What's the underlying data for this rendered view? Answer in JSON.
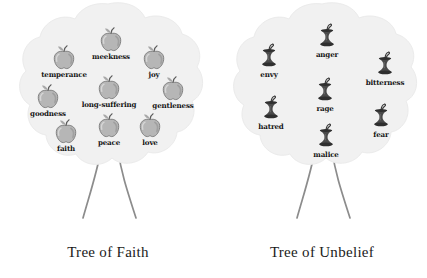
{
  "figure": {
    "caption_left": "Tree of Faith",
    "caption_right": "Tree of Unbelief"
  },
  "colors": {
    "canopy_fill": "#f1f1f1",
    "canopy_edge": "#e6e6e6",
    "trunk_stroke": "#8c8c8c",
    "apple_light": "#c9c9c9",
    "apple_dark": "#8e8e8e",
    "apple_outline": "#6f6f6f",
    "leaf": "#a8a8a8",
    "stem": "#5a5a5a",
    "core_dark": "#3a3a3a",
    "label_text": "#151515",
    "title_text": "#1a1a1a",
    "background": "#ffffff"
  },
  "trees": [
    {
      "id": "tree-faith",
      "name": "tree-of-faith",
      "title": "Tree of Faith",
      "fruit_type": "whole-apple",
      "fruits": [
        {
          "label": "meekness",
          "x": 103,
          "y": 26
        },
        {
          "label": "temperance",
          "x": 56,
          "y": 44
        },
        {
          "label": "joy",
          "x": 146,
          "y": 44
        },
        {
          "label": "long-suffering",
          "x": 101,
          "y": 74
        },
        {
          "label": "gentleness",
          "x": 165,
          "y": 75
        },
        {
          "label": "goodness",
          "x": 40,
          "y": 83
        },
        {
          "label": "faith",
          "x": 58,
          "y": 118
        },
        {
          "label": "peace",
          "x": 101,
          "y": 112
        },
        {
          "label": "love",
          "x": 142,
          "y": 112
        }
      ]
    },
    {
      "id": "tree-unbelief",
      "name": "tree-of-unbelief",
      "title": "Tree of Unbelief",
      "fruit_type": "apple-core",
      "fruits": [
        {
          "label": "anger",
          "x": 105,
          "y": 22
        },
        {
          "label": "envy",
          "x": 47,
          "y": 42
        },
        {
          "label": "bitterness",
          "x": 163,
          "y": 50
        },
        {
          "label": "rage",
          "x": 103,
          "y": 76
        },
        {
          "label": "hatred",
          "x": 49,
          "y": 94
        },
        {
          "label": "fear",
          "x": 159,
          "y": 102
        },
        {
          "label": "malice",
          "x": 104,
          "y": 122
        }
      ]
    }
  ]
}
